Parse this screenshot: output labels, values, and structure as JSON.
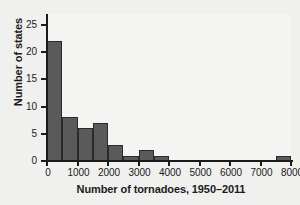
{
  "chart_data": {
    "type": "bar",
    "title": "",
    "xlabel": "Number of tornadoes, 1950–2011",
    "ylabel": "Number of states",
    "bin_width": 500,
    "bin_starts": [
      0,
      500,
      1000,
      1500,
      2000,
      2500,
      3000,
      3500,
      4000,
      4500,
      5000,
      5500,
      6000,
      6500,
      7000,
      7500
    ],
    "categories": [
      "0–500",
      "500–1000",
      "1000–1500",
      "1500–2000",
      "2000–2500",
      "2500–3000",
      "3000–3500",
      "3500–4000",
      "4000–4500",
      "4500–5000",
      "5000–5500",
      "5500–6000",
      "6000–6500",
      "6500–7000",
      "7000–7500",
      "7500–8000"
    ],
    "values": [
      22,
      8,
      6,
      7,
      3,
      1,
      2,
      1,
      0,
      0,
      0,
      0,
      0,
      0,
      0,
      1
    ],
    "xlim": [
      0,
      8000
    ],
    "ylim": [
      0,
      27
    ],
    "xticks": [
      0,
      1000,
      2000,
      3000,
      4000,
      5000,
      6000,
      7000,
      8000
    ],
    "xtick_labels": [
      "0",
      "1000",
      "2000",
      "3000",
      "4000",
      "5000",
      "6000",
      "7000",
      "8000"
    ],
    "yticks": [
      0,
      5,
      10,
      15,
      20,
      25
    ],
    "ytick_labels": [
      "0",
      "5",
      "10",
      "15",
      "20",
      "25"
    ],
    "grid": false,
    "legend": "none",
    "bar_color": "#5a5a5a",
    "bar_edge_color": "#2a2a2a",
    "plot_background": "#f4f4f2",
    "text_color": "#1b1b1b"
  }
}
